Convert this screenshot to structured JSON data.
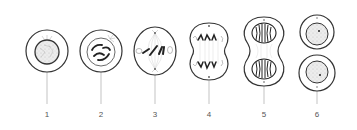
{
  "diagram": {
    "title": "",
    "stages": [
      {
        "id": 1,
        "label": "1",
        "x": 47,
        "depiction": "interphase-cell-round-nucleus"
      },
      {
        "id": 2,
        "label": "2",
        "x": 101,
        "depiction": "prophase-condensed-chromosomes"
      },
      {
        "id": 3,
        "label": "3",
        "x": 155,
        "depiction": "metaphase-chromosomes-at-equator-spindle"
      },
      {
        "id": 4,
        "label": "4",
        "x": 209,
        "depiction": "anaphase-chromosomes-pulled-to-poles"
      },
      {
        "id": 5,
        "label": "5",
        "x": 264,
        "depiction": "telophase-two-nuclei-forming"
      },
      {
        "id": 6,
        "label": "6",
        "x": 317,
        "depiction": "two-daughter-cells"
      }
    ],
    "colors": {
      "outline": "#333333",
      "leader_line": "#999999",
      "nucleus_fill": "#e6e6e6",
      "chromosome": "#222222",
      "label_text": "#555555"
    }
  }
}
